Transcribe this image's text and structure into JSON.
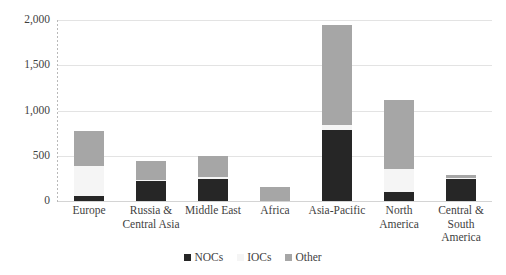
{
  "chart_data": {
    "type": "bar",
    "stacked": true,
    "title": "",
    "subtitle": "",
    "xlabel": "",
    "ylabel": "",
    "ylim": [
      0,
      2000
    ],
    "ytick_values": [
      0,
      500,
      1000,
      1500,
      2000
    ],
    "ytick_labels": [
      "0",
      "500",
      "1,000",
      "1,500",
      "2,000"
    ],
    "grid": true,
    "legend_position": "bottom-center",
    "categories": [
      "Europe",
      "Russia &\nCentral Asia",
      "Middle East",
      "Africa",
      "Asia-Pacific",
      "North\nAmerica",
      "Central &\nSouth\nAmerica"
    ],
    "series": [
      {
        "name": "NOCs",
        "color": "#262626",
        "values": [
          60,
          220,
          245,
          0,
          785,
          100,
          245
        ]
      },
      {
        "name": "IOCs",
        "color": "#f5f5f5",
        "values": [
          330,
          10,
          15,
          0,
          55,
          250,
          10
        ]
      },
      {
        "name": "Other",
        "color": "#a6a6a6",
        "values": [
          385,
          215,
          240,
          155,
          1105,
          765,
          35
        ]
      }
    ],
    "totals": [
      775,
      445,
      500,
      155,
      1945,
      1115,
      290
    ]
  },
  "legend": {
    "items": [
      {
        "label": "NOCs",
        "color": "#262626"
      },
      {
        "label": "IOCs",
        "color": "#f5f5f5"
      },
      {
        "label": "Other",
        "color": "#a6a6a6"
      }
    ]
  },
  "colors": {
    "nocs": "#262626",
    "iocs": "#f5f5f5",
    "other": "#a6a6a6",
    "gridline": "#e3e3e3",
    "axis": "#b9b9b9",
    "text": "#3f3f3f",
    "background": "#ffffff"
  }
}
